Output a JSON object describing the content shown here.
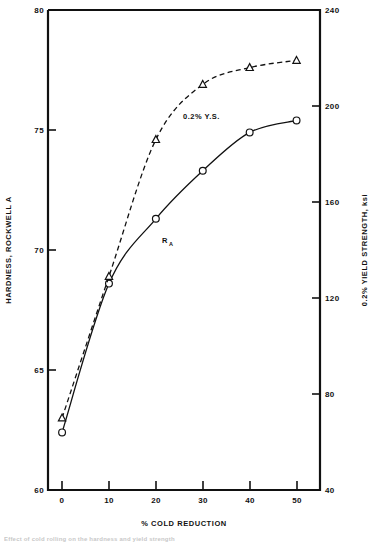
{
  "chart_data": {
    "type": "line",
    "title": "",
    "xlabel": "% COLD REDUCTION",
    "ylabel": "HARDNESS, ROCKWELL A",
    "y2label": "0.2% YIELD STRENGTH, ksi",
    "x": [
      0,
      10,
      20,
      30,
      40,
      50
    ],
    "xlim": [
      -3,
      55
    ],
    "ylim": [
      60,
      80
    ],
    "y2lim": [
      40,
      240
    ],
    "grid": false,
    "legend": "inline-annotations",
    "xticks": [
      "0",
      "10",
      "20",
      "30",
      "40",
      "50"
    ],
    "xtick_values": [
      0,
      10,
      20,
      30,
      40,
      50
    ],
    "yticks": [
      "60",
      "65",
      "70",
      "75",
      "80"
    ],
    "ytick_values": [
      60,
      65,
      70,
      75,
      80
    ],
    "y2ticks": [
      "40",
      "80",
      "120",
      "160",
      "200",
      "240"
    ],
    "y2tick_values": [
      40,
      80,
      120,
      160,
      200,
      240
    ],
    "series": [
      {
        "name": "R_A",
        "label": "R",
        "label_subscript": "A",
        "axis": "left",
        "marker": "circle",
        "line": "solid",
        "values": [
          62.4,
          68.6,
          71.3,
          73.3,
          74.9,
          75.4
        ]
      },
      {
        "name": "0.2% Y.S.",
        "label": "0.2% Y.S.",
        "axis": "right",
        "marker": "triangle",
        "line": "dashed",
        "values": [
          70,
          129,
          186,
          209,
          216,
          219
        ],
        "values_left_axis_equivalent": [
          63.0,
          68.9,
          74.6,
          76.9,
          77.6,
          77.9
        ]
      }
    ],
    "annotations": [
      {
        "text": "0.2% Y.S.",
        "x": 21.5,
        "y_left_axis": 76.0
      },
      {
        "text": "R",
        "subscript": "A",
        "x": 20.5,
        "y_left_axis": 70.6
      }
    ],
    "colors": {
      "ink": "#111111",
      "background": "#ffffff"
    }
  },
  "caption": {
    "text": "Effect of cold rolling on the hardness and yield strength"
  }
}
